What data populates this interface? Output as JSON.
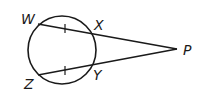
{
  "diagram": {
    "type": "geometry",
    "points": {
      "W": {
        "label": "W",
        "x": 38,
        "y": 24
      },
      "X": {
        "label": "X",
        "x": 91,
        "y": 34
      },
      "Z": {
        "label": "Z",
        "x": 38,
        "y": 75
      },
      "Y": {
        "label": "Y",
        "x": 92,
        "y": 66
      },
      "P": {
        "label": "P",
        "x": 177,
        "y": 49
      }
    },
    "circle": {
      "cx": 62,
      "cy": 50,
      "r": 34
    },
    "segments": [
      {
        "from": "W",
        "to": "P"
      },
      {
        "from": "Z",
        "to": "P"
      }
    ],
    "congruence_marks": [
      {
        "segment": "WX",
        "ticks": 1
      },
      {
        "segment": "ZY",
        "ticks": 1
      }
    ],
    "stroke_color": "#1a1a1a"
  }
}
